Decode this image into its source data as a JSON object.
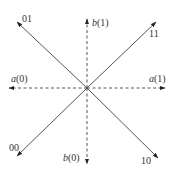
{
  "diagram": {
    "center": {
      "x": 87,
      "y": 88
    },
    "colors": {
      "line": "#555555",
      "arrow": "#222222",
      "text": "#333333"
    },
    "solid_arrows": [
      {
        "id": "01",
        "label": "01",
        "tip": {
          "x": 17,
          "y": 22
        },
        "label_pos": {
          "x": 22,
          "y": 22
        }
      },
      {
        "id": "11",
        "label": "11",
        "tip": {
          "x": 156,
          "y": 22
        },
        "label_pos": {
          "x": 149,
          "y": 37
        }
      },
      {
        "id": "00",
        "label": "00",
        "tip": {
          "x": 17,
          "y": 156
        },
        "label_pos": {
          "x": 9,
          "y": 151
        }
      },
      {
        "id": "10",
        "label": "10",
        "tip": {
          "x": 158,
          "y": 158
        },
        "label_pos": {
          "x": 141,
          "y": 164
        }
      }
    ],
    "dashed_arrows": [
      {
        "id": "a0",
        "fn": "a",
        "arg": "(0)",
        "tip": {
          "x": 9,
          "y": 88
        },
        "label_pos": {
          "x": 11,
          "y": 82
        }
      },
      {
        "id": "a1",
        "fn": "a",
        "arg": "(1)",
        "tip": {
          "x": 165,
          "y": 88
        },
        "label_pos": {
          "x": 149,
          "y": 82
        }
      },
      {
        "id": "b1",
        "fn": "b",
        "arg": "(1)",
        "tip": {
          "x": 87,
          "y": 19
        },
        "label_pos": {
          "x": 92,
          "y": 26
        }
      },
      {
        "id": "b0",
        "fn": "b",
        "arg": "(0)",
        "tip": {
          "x": 87,
          "y": 164
        },
        "label_pos": {
          "x": 63,
          "y": 161
        }
      }
    ]
  }
}
